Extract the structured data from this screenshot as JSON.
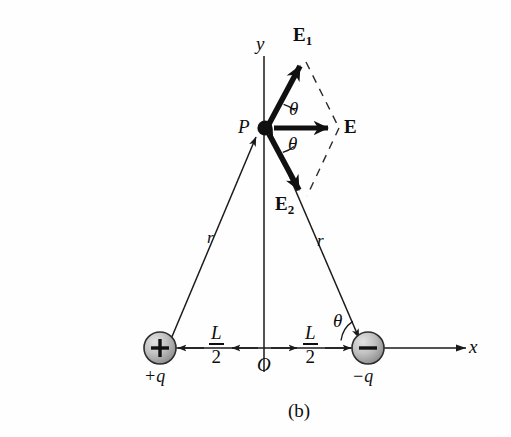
{
  "figure": {
    "caption": "(b)"
  },
  "axes": {
    "x_label": "x",
    "y_label": "y",
    "origin_label": "O"
  },
  "points": {
    "field_point_label": "P"
  },
  "vectors": [
    {
      "name": "E1",
      "label": "E",
      "subscript": "1"
    },
    {
      "name": "E2",
      "label": "E",
      "subscript": "2"
    },
    {
      "name": "E",
      "label": "E",
      "subscript": ""
    }
  ],
  "angles": [
    {
      "name": "theta-upper",
      "label": "θ"
    },
    {
      "name": "theta-lower",
      "label": "θ"
    },
    {
      "name": "theta-axis",
      "label": "θ"
    }
  ],
  "distances": [
    {
      "name": "r-left",
      "label": "r"
    },
    {
      "name": "r-right",
      "label": "r"
    },
    {
      "name": "half-L-left",
      "numerator": "L",
      "denominator": "2"
    },
    {
      "name": "half-L-right",
      "numerator": "L",
      "denominator": "2"
    }
  ],
  "charges": [
    {
      "name": "positive-charge",
      "label": "+q",
      "sign": "+"
    },
    {
      "name": "negative-charge",
      "label": "−q",
      "sign": "−"
    }
  ],
  "colors": {
    "ink": "#0d0d0d",
    "line": "#1a1a1a",
    "charge_fill_light": "#d8d8d8",
    "charge_fill_dark": "#8e8e8e",
    "background": "#fefefe"
  }
}
